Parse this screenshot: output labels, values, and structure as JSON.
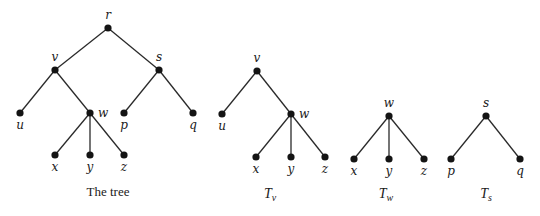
{
  "diagram": {
    "trees": [
      {
        "id": "full",
        "caption": "The tree",
        "caption_sub": "",
        "caption_pos": [
          108,
          196
        ],
        "nodes": [
          {
            "name": "r",
            "x": 108,
            "y": 28,
            "label_dx": 0,
            "label_dy": -9,
            "anchor": "middle"
          },
          {
            "name": "v",
            "x": 55,
            "y": 70,
            "label_dx": 0,
            "label_dy": -9,
            "anchor": "middle"
          },
          {
            "name": "s",
            "x": 159,
            "y": 70,
            "label_dx": 0,
            "label_dy": -9,
            "anchor": "middle"
          },
          {
            "name": "u",
            "x": 20,
            "y": 113,
            "label_dx": 0,
            "label_dy": 16,
            "anchor": "middle"
          },
          {
            "name": "w",
            "x": 90,
            "y": 113,
            "label_dx": 8,
            "label_dy": 4,
            "anchor": "start"
          },
          {
            "name": "p",
            "x": 124,
            "y": 113,
            "label_dx": 0,
            "label_dy": 16,
            "anchor": "middle"
          },
          {
            "name": "q",
            "x": 193,
            "y": 113,
            "label_dx": 0,
            "label_dy": 16,
            "anchor": "middle"
          },
          {
            "name": "x",
            "x": 55,
            "y": 155,
            "label_dx": 0,
            "label_dy": 16,
            "anchor": "middle"
          },
          {
            "name": "y",
            "x": 90,
            "y": 155,
            "label_dx": 0,
            "label_dy": 16,
            "anchor": "middle"
          },
          {
            "name": "z",
            "x": 124,
            "y": 155,
            "label_dx": 0,
            "label_dy": 16,
            "anchor": "middle"
          }
        ],
        "edges": [
          [
            "r",
            "v"
          ],
          [
            "r",
            "s"
          ],
          [
            "v",
            "u"
          ],
          [
            "v",
            "w"
          ],
          [
            "s",
            "p"
          ],
          [
            "s",
            "q"
          ],
          [
            "w",
            "x"
          ],
          [
            "w",
            "y"
          ],
          [
            "w",
            "z"
          ]
        ]
      },
      {
        "id": "T_v",
        "caption": "T",
        "caption_sub": "v",
        "caption_pos": [
          270,
          198
        ],
        "nodes": [
          {
            "name": "v",
            "x": 257,
            "y": 71,
            "label_dx": 0,
            "label_dy": -9,
            "anchor": "middle"
          },
          {
            "name": "u",
            "x": 222,
            "y": 114,
            "label_dx": 0,
            "label_dy": 16,
            "anchor": "middle"
          },
          {
            "name": "w",
            "x": 291,
            "y": 114,
            "label_dx": 8,
            "label_dy": 4,
            "anchor": "start"
          },
          {
            "name": "x",
            "x": 256,
            "y": 157,
            "label_dx": 0,
            "label_dy": 16,
            "anchor": "middle"
          },
          {
            "name": "y",
            "x": 291,
            "y": 157,
            "label_dx": 0,
            "label_dy": 16,
            "anchor": "middle"
          },
          {
            "name": "z",
            "x": 325,
            "y": 157,
            "label_dx": 0,
            "label_dy": 16,
            "anchor": "middle"
          }
        ],
        "edges": [
          [
            "v",
            "u"
          ],
          [
            "v",
            "w"
          ],
          [
            "w",
            "x"
          ],
          [
            "w",
            "y"
          ],
          [
            "w",
            "z"
          ]
        ]
      },
      {
        "id": "T_w",
        "caption": "T",
        "caption_sub": "w",
        "caption_pos": [
          386,
          198
        ],
        "nodes": [
          {
            "name": "w",
            "x": 389,
            "y": 116,
            "label_dx": 0,
            "label_dy": -9,
            "anchor": "middle"
          },
          {
            "name": "x",
            "x": 354,
            "y": 159,
            "label_dx": 0,
            "label_dy": 16,
            "anchor": "middle"
          },
          {
            "name": "y",
            "x": 389,
            "y": 159,
            "label_dx": 0,
            "label_dy": 16,
            "anchor": "middle"
          },
          {
            "name": "z",
            "x": 424,
            "y": 159,
            "label_dx": 0,
            "label_dy": 16,
            "anchor": "middle"
          }
        ],
        "edges": [
          [
            "w",
            "x"
          ],
          [
            "w",
            "y"
          ],
          [
            "w",
            "z"
          ]
        ]
      },
      {
        "id": "T_s",
        "caption": "T",
        "caption_sub": "s",
        "caption_pos": [
          486,
          198
        ],
        "nodes": [
          {
            "name": "s",
            "x": 486,
            "y": 116,
            "label_dx": 0,
            "label_dy": -9,
            "anchor": "middle"
          },
          {
            "name": "p",
            "x": 451,
            "y": 159,
            "label_dx": 0,
            "label_dy": 16,
            "anchor": "middle"
          },
          {
            "name": "q",
            "x": 520,
            "y": 159,
            "label_dx": 0,
            "label_dy": 16,
            "anchor": "middle"
          }
        ],
        "edges": [
          [
            "s",
            "p"
          ],
          [
            "s",
            "q"
          ]
        ]
      }
    ]
  }
}
